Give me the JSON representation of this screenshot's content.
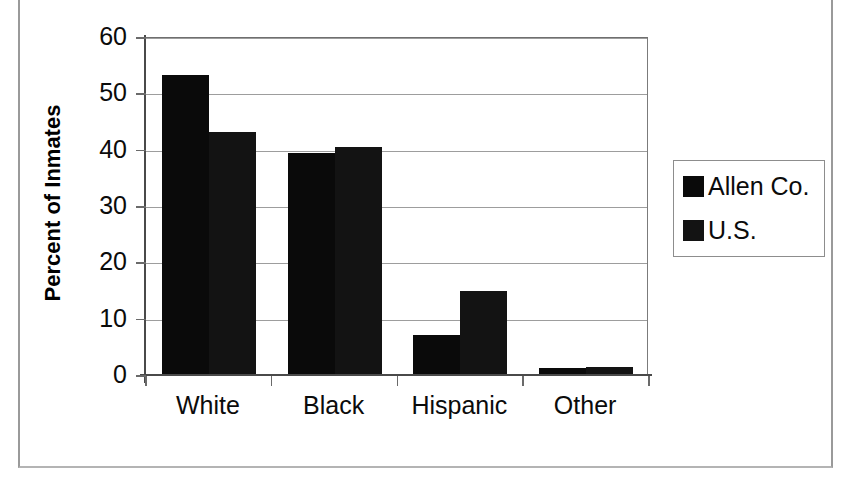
{
  "chart_data": {
    "type": "bar",
    "title": "",
    "xlabel": "",
    "ylabel": "Percent of Inmates",
    "categories": [
      "White",
      "Black",
      "Hispanic",
      "Other"
    ],
    "series": [
      {
        "name": "Allen Co.",
        "values": [
          53.0,
          39.2,
          7.0,
          1.0
        ],
        "color": "#0a0a0a"
      },
      {
        "name": "U.S.",
        "values": [
          42.9,
          40.3,
          14.7,
          1.3
        ],
        "color": "#131313"
      }
    ],
    "ylim": [
      0,
      60
    ],
    "yticks": [
      0,
      10,
      20,
      30,
      40,
      50,
      60
    ],
    "ytick_labels": [
      "0",
      "10",
      "20",
      "30",
      "40",
      "50",
      "60"
    ],
    "grid": true,
    "legend_position": "right"
  },
  "legend": {
    "items": [
      {
        "label": "Allen Co."
      },
      {
        "label": "U.S."
      }
    ]
  },
  "caption": {
    "sliver_text": ""
  }
}
